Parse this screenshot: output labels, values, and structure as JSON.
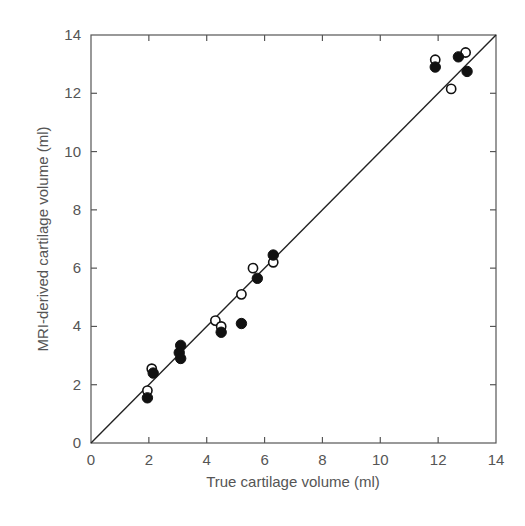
{
  "chart_data": {
    "type": "scatter",
    "title": "",
    "xlabel": "True cartilage volume (ml)",
    "ylabel": "MRI-derived cartilage volume (ml)",
    "xlim": [
      0,
      14
    ],
    "ylim": [
      0,
      14
    ],
    "xticks": [
      0,
      2,
      4,
      6,
      8,
      10,
      12,
      14
    ],
    "yticks": [
      0,
      2,
      4,
      6,
      8,
      10,
      12,
      14
    ],
    "grid": false,
    "legend": null,
    "reference_line": {
      "label": "line of identity",
      "from": [
        0,
        0
      ],
      "to": [
        14,
        14
      ]
    },
    "series": [
      {
        "name": "open circles",
        "marker": "open-circle",
        "points": [
          [
            1.95,
            1.8
          ],
          [
            2.1,
            2.55
          ],
          [
            4.3,
            4.2
          ],
          [
            4.5,
            4.0
          ],
          [
            5.2,
            5.1
          ],
          [
            5.6,
            6.0
          ],
          [
            6.3,
            6.2
          ],
          [
            11.9,
            13.15
          ],
          [
            12.45,
            12.15
          ],
          [
            12.95,
            13.4
          ]
        ]
      },
      {
        "name": "filled circles",
        "marker": "filled-circle",
        "points": [
          [
            1.95,
            1.55
          ],
          [
            2.15,
            2.4
          ],
          [
            3.1,
            3.35
          ],
          [
            3.05,
            3.1
          ],
          [
            3.1,
            2.9
          ],
          [
            4.5,
            3.8
          ],
          [
            5.2,
            4.1
          ],
          [
            5.75,
            5.65
          ],
          [
            6.3,
            6.45
          ],
          [
            11.9,
            12.9
          ],
          [
            12.7,
            13.25
          ],
          [
            13.0,
            12.75
          ]
        ]
      }
    ]
  },
  "colors": {
    "axis": "#555555",
    "line": "#222222",
    "marker": "#111111",
    "text": "#555555"
  }
}
